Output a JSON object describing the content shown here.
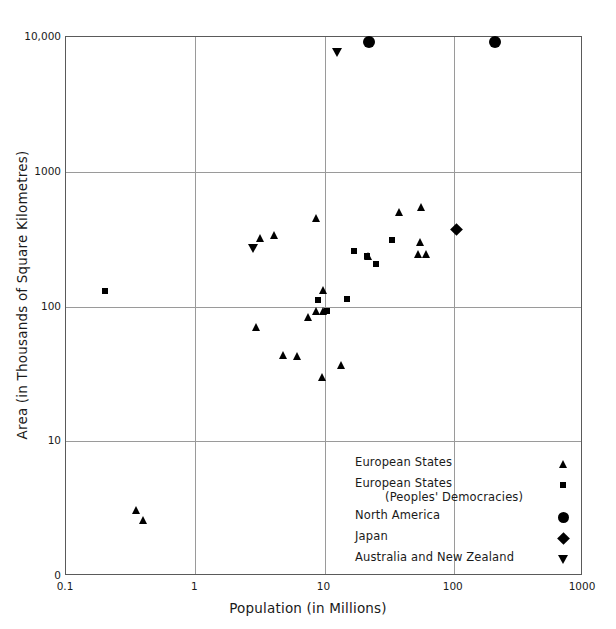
{
  "chart_data": {
    "type": "scatter",
    "title": "",
    "xlabel": "Population (in Millions)",
    "ylabel": "Area (in Thousands of Square Kilometres)",
    "xscale": "log",
    "yscale": "log",
    "xlim": [
      0.1,
      1000
    ],
    "ylim": [
      1,
      10000
    ],
    "grid": true,
    "xticks": [
      "0.1",
      "1",
      "10",
      "100",
      "1000"
    ],
    "xtick_values": [
      0.1,
      1,
      10,
      100,
      1000
    ],
    "yticks": [
      "0",
      "10",
      "100",
      "1000",
      "10,000"
    ],
    "ytick_values": [
      1,
      10,
      100,
      1000,
      10000
    ],
    "legend_position": "inside lower-right",
    "series": [
      {
        "name": "European States",
        "marker": "triangle-up",
        "points": [
          {
            "x": 0.35,
            "y": 3.1
          },
          {
            "x": 0.4,
            "y": 2.6
          },
          {
            "x": 3.2,
            "y": 324
          },
          {
            "x": 4.1,
            "y": 337
          },
          {
            "x": 3.0,
            "y": 70
          },
          {
            "x": 8.6,
            "y": 450
          },
          {
            "x": 7.5,
            "y": 84
          },
          {
            "x": 9.8,
            "y": 132
          },
          {
            "x": 9.9,
            "y": 93
          },
          {
            "x": 8.7,
            "y": 92
          },
          {
            "x": 4.8,
            "y": 44
          },
          {
            "x": 6.2,
            "y": 43
          },
          {
            "x": 9.6,
            "y": 30
          },
          {
            "x": 13.5,
            "y": 37
          },
          {
            "x": 22.0,
            "y": 237
          },
          {
            "x": 38.0,
            "y": 505
          },
          {
            "x": 56.0,
            "y": 547
          },
          {
            "x": 55.0,
            "y": 301
          },
          {
            "x": 53.0,
            "y": 244
          },
          {
            "x": 61.0,
            "y": 244
          }
        ]
      },
      {
        "name": "European States (Peoples' Democracies)",
        "marker": "square",
        "points": [
          {
            "x": 0.2,
            "y": 131
          },
          {
            "x": 8.9,
            "y": 111
          },
          {
            "x": 10.5,
            "y": 93
          },
          {
            "x": 14.8,
            "y": 114
          },
          {
            "x": 21.5,
            "y": 238
          },
          {
            "x": 25.0,
            "y": 207
          },
          {
            "x": 33.0,
            "y": 313
          },
          {
            "x": 17.0,
            "y": 256
          }
        ]
      },
      {
        "name": "North America",
        "marker": "circle",
        "points": [
          {
            "x": 22.0,
            "y": 9220
          },
          {
            "x": 210.0,
            "y": 9220
          }
        ]
      },
      {
        "name": "Japan",
        "marker": "diamond",
        "points": [
          {
            "x": 105.0,
            "y": 370
          }
        ]
      },
      {
        "name": "Australia and New Zealand",
        "marker": "triangle-down",
        "points": [
          {
            "x": 12.5,
            "y": 7700
          },
          {
            "x": 2.8,
            "y": 269
          }
        ]
      }
    ]
  },
  "axes": {
    "x_title": "Population (in Millions)",
    "y_title": "Area (in Thousands of Square Kilometres)",
    "x_tick_labels": [
      "0.1",
      "1",
      "10",
      "100",
      "1000"
    ],
    "y_tick_labels": [
      "10,000",
      "1000",
      "100",
      "10",
      "0"
    ]
  },
  "legend": {
    "entries": [
      {
        "label": "European States",
        "label2": "",
        "symbol": "triangle-up-icon"
      },
      {
        "label": "European States",
        "label2": "(Peoples' Democracies)",
        "symbol": "square-icon"
      },
      {
        "label": "North America",
        "label2": "",
        "symbol": "circle-icon"
      },
      {
        "label": "Japan",
        "label2": "",
        "symbol": "diamond-icon"
      },
      {
        "label": "Australia and New Zealand",
        "label2": "",
        "symbol": "triangle-down-icon"
      }
    ]
  },
  "style": {
    "marker_color": "#000000",
    "grid_color": "#9a9a9a",
    "frame_color": "#5a5a5a",
    "background": "#ffffff"
  }
}
